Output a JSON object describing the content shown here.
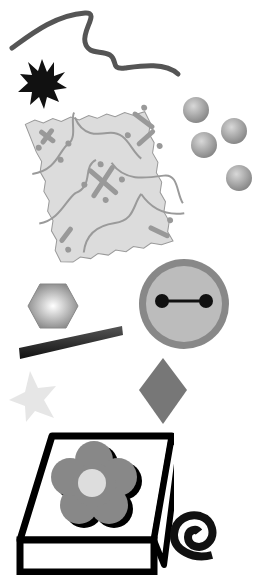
{
  "scene": {
    "description": "Grayscale clip-art shapes collection",
    "background": "#ffffff",
    "shapes": [
      {
        "name": "wavy-line",
        "color": "#555555"
      },
      {
        "name": "starburst",
        "color": "#111111",
        "points": 12
      },
      {
        "name": "patterned-tile",
        "fill": "#dddddd",
        "pattern": "#999999"
      },
      {
        "name": "spheres",
        "count": 4,
        "color": "#999999"
      },
      {
        "name": "hexagon",
        "color": "#aaaaaa"
      },
      {
        "name": "button-face",
        "outer": "#888888",
        "inner": "#bbbbbb",
        "feature": "#111111"
      },
      {
        "name": "bar",
        "color": "#222222"
      },
      {
        "name": "star",
        "color": "#e6e6e6"
      },
      {
        "name": "diamond",
        "color": "#777777"
      },
      {
        "name": "flower-box",
        "box": "#000000",
        "flower": "#888888",
        "center": "#dddddd"
      },
      {
        "name": "spiral",
        "color": "#111111"
      }
    ]
  }
}
